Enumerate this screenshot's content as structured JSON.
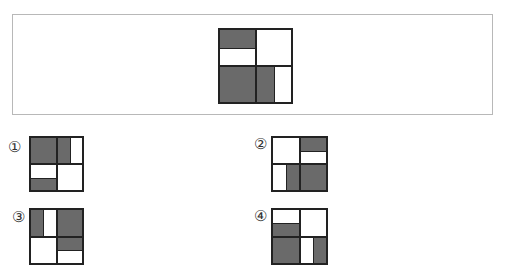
{
  "question": {
    "shade_color": "#6a6a6a",
    "main_figure": {
      "quadrants": {
        "top_left": "top-half",
        "top_right": "none",
        "bottom_left": "full",
        "bottom_right": "left-half"
      }
    },
    "options": [
      {
        "label": "①",
        "quadrants": {
          "top_left": "full",
          "top_right": "left-half",
          "bottom_left": "bottom-half",
          "bottom_right": "none"
        }
      },
      {
        "label": "②",
        "quadrants": {
          "top_left": "none",
          "top_right": "top-half",
          "bottom_left": "right-half",
          "bottom_right": "full"
        }
      },
      {
        "label": "③",
        "quadrants": {
          "top_left": "left-half",
          "top_right": "full",
          "bottom_left": "none",
          "bottom_right": "top-half"
        }
      },
      {
        "label": "④",
        "quadrants": {
          "top_left": "bottom-half",
          "top_right": "none",
          "bottom_left": "full",
          "bottom_right": "right-half"
        }
      }
    ]
  }
}
